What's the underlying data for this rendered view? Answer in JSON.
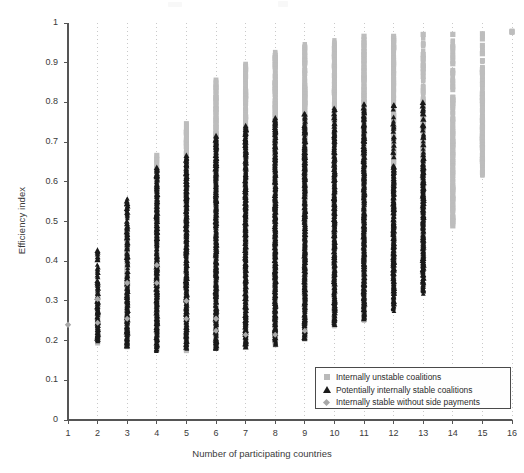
{
  "chart_data": {
    "type": "scatter",
    "title": "",
    "xlabel": "Number of participating countries",
    "ylabel": "Efficiency index",
    "xlim": [
      1,
      16
    ],
    "ylim": [
      0,
      1
    ],
    "xticks": [
      1,
      2,
      3,
      4,
      5,
      6,
      7,
      8,
      9,
      10,
      11,
      12,
      13,
      14,
      15,
      16
    ],
    "yticks": [
      0,
      0.1,
      0.2,
      0.3,
      0.4,
      0.5,
      0.6,
      0.7,
      0.8,
      0.9,
      1
    ],
    "ytick_labels": [
      "0",
      "0.1",
      "0.2",
      "0.3",
      "0.4",
      "0.5",
      "0.6",
      "0.7",
      "0.8",
      "0.9",
      "1"
    ],
    "xtick_labels": [
      "1",
      "2",
      "3",
      "4",
      "5",
      "6",
      "7",
      "8",
      "9",
      "10",
      "11",
      "12",
      "13",
      "14",
      "15",
      "16"
    ],
    "grid": "vertical-dotted",
    "legend_position": "lower-right",
    "colors": {
      "unstable": "#bdbdbd",
      "stable": "#1a1a1a",
      "side_payments": "#a8a8a8",
      "axis": "#555555",
      "grid": "#c9c9c9",
      "background": "#ffffff"
    },
    "series": [
      {
        "name": "Internally unstable coalitions",
        "marker": "square",
        "color": "#bdbdbd",
        "spans": [
          {
            "x": 1,
            "low": null,
            "high": null
          },
          {
            "x": 2,
            "low": 0.195,
            "high": 0.325
          },
          {
            "x": 3,
            "low": 0.185,
            "high": 0.475
          },
          {
            "x": 4,
            "low": 0.175,
            "high": 0.665
          },
          {
            "x": 5,
            "low": 0.175,
            "high": 0.745
          },
          {
            "x": 6,
            "low": 0.18,
            "high": 0.855
          },
          {
            "x": 7,
            "low": 0.185,
            "high": 0.895
          },
          {
            "x": 8,
            "low": 0.19,
            "high": 0.925
          },
          {
            "x": 9,
            "low": 0.205,
            "high": 0.945
          },
          {
            "x": 10,
            "low": 0.235,
            "high": 0.955
          },
          {
            "x": 11,
            "low": 0.25,
            "high": 0.965
          },
          {
            "x": 12,
            "low": 0.32,
            "high": 0.965
          },
          {
            "x": 13,
            "low": 0.395,
            "high": 0.975
          },
          {
            "x": 14,
            "low": 0.49,
            "high": 0.975
          },
          {
            "x": 15,
            "low": 0.615,
            "high": 0.98
          },
          {
            "x": 16,
            "low": 0.975,
            "high": 0.985
          }
        ]
      },
      {
        "name": "Potentially internally stable coalitions",
        "marker": "triangle",
        "color": "#1a1a1a",
        "spans": [
          {
            "x": 2,
            "low": 0.2,
            "high": 0.43
          },
          {
            "x": 3,
            "low": 0.185,
            "high": 0.56
          },
          {
            "x": 4,
            "low": 0.175,
            "high": 0.635
          },
          {
            "x": 5,
            "low": 0.18,
            "high": 0.665
          },
          {
            "x": 6,
            "low": 0.18,
            "high": 0.715
          },
          {
            "x": 7,
            "low": 0.185,
            "high": 0.74
          },
          {
            "x": 8,
            "low": 0.19,
            "high": 0.76
          },
          {
            "x": 9,
            "low": 0.205,
            "high": 0.775
          },
          {
            "x": 10,
            "low": 0.24,
            "high": 0.79
          },
          {
            "x": 11,
            "low": 0.255,
            "high": 0.8
          },
          {
            "x": 12,
            "low": 0.275,
            "high": 0.8
          },
          {
            "x": 13,
            "low": 0.32,
            "high": 0.805
          }
        ]
      },
      {
        "name": "Internally stable without side payments",
        "marker": "diamond",
        "color": "#a8a8a8",
        "points": [
          {
            "x": 1,
            "y": 0.24
          },
          {
            "x": 2,
            "y": 0.305
          },
          {
            "x": 3,
            "y": 0.345
          },
          {
            "x": 4,
            "y": 0.39
          },
          {
            "x": 5,
            "y": 0.3
          },
          {
            "x": 6,
            "y": 0.255
          }
        ]
      }
    ]
  },
  "legend": {
    "items": [
      {
        "label": "Internally unstable coalitions",
        "marker": "square"
      },
      {
        "label": "Potentially internally stable coalitions",
        "marker": "triangle"
      },
      {
        "label": "Internally stable without side payments",
        "marker": "diamond"
      }
    ]
  }
}
